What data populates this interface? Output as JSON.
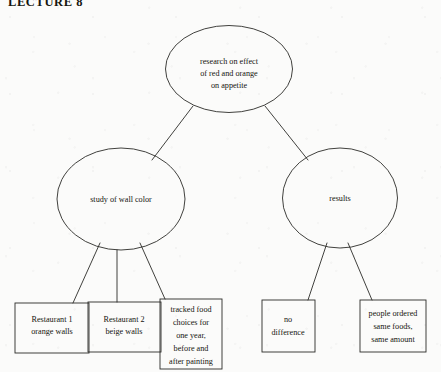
{
  "page": {
    "title": "LECTURE 8",
    "background_color": "#fbfbfa",
    "ink_color": "#2b2b28"
  },
  "diagram": {
    "type": "hierarchy-tree",
    "root": {
      "id": "root",
      "shape": "ellipse",
      "lines": [
        "research on effect",
        "of red and orange",
        "on appetite"
      ]
    },
    "branches": [
      {
        "id": "study",
        "shape": "ellipse",
        "lines": [
          "study of wall color"
        ],
        "children": [
          {
            "id": "restaurant-1",
            "shape": "rect",
            "lines": [
              "Restaurant 1",
              "orange walls"
            ]
          },
          {
            "id": "restaurant-2",
            "shape": "rect",
            "lines": [
              "Restaurant 2",
              "beige walls"
            ]
          },
          {
            "id": "tracked-food",
            "shape": "rect",
            "lines": [
              "tracked food",
              "choices for",
              "one year,",
              "before and",
              "after painting"
            ]
          }
        ]
      },
      {
        "id": "results",
        "shape": "ellipse",
        "lines": [
          "results"
        ],
        "children": [
          {
            "id": "no-difference",
            "shape": "rect",
            "lines": [
              "no",
              "difference"
            ]
          },
          {
            "id": "same-foods",
            "shape": "rect",
            "lines": [
              "people ordered",
              "same foods,",
              "same amount"
            ]
          }
        ]
      }
    ]
  }
}
